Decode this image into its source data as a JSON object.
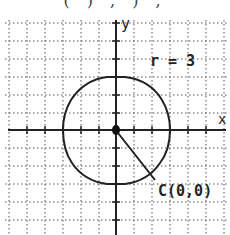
{
  "header": {
    "cropped_text": "(   ) ,  ) , "
  },
  "diagram": {
    "type": "circle-on-coordinate-grid",
    "axis_labels": {
      "x": "x",
      "y": "y"
    },
    "center_label": "C(0,0)",
    "radius_label": "r = 3",
    "center": [
      0,
      0
    ],
    "radius": 3,
    "grid": {
      "spacing_px": 18,
      "origin_px": [
        116,
        130
      ],
      "style": "dotted"
    },
    "colors": {
      "line": "#222222",
      "grid": "#555555",
      "background": "#ffffff"
    }
  }
}
